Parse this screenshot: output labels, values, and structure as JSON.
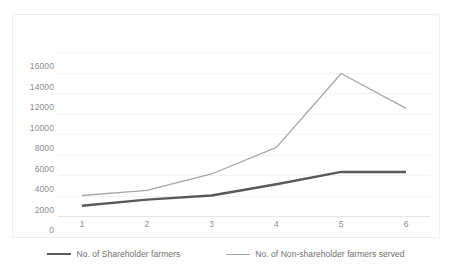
{
  "chart_data": {
    "type": "line",
    "title": "",
    "xlabel": "",
    "ylabel": "",
    "categories": [
      "1",
      "2",
      "3",
      "4",
      "5",
      "6"
    ],
    "ylim": [
      0,
      16000
    ],
    "ytick_step": 2000,
    "yticks": [
      "16000",
      "14000",
      "12000",
      "10000",
      "8000",
      "6000",
      "4000",
      "2000",
      "0"
    ],
    "grid": true,
    "legend_position": "bottom",
    "series": [
      {
        "name": "No. of Shareholder farmers",
        "color": "#595959",
        "width": 2.4,
        "values": [
          1000,
          1600,
          2000,
          3100,
          4300,
          4300
        ]
      },
      {
        "name": "No. of Non-shareholder farmers served",
        "color": "#a6a6a6",
        "width": 1.3,
        "values": [
          2000,
          2500,
          4100,
          6700,
          13900,
          10500
        ]
      }
    ]
  },
  "legend": {
    "items": [
      {
        "label": "No. of Shareholder farmers"
      },
      {
        "label": "No. of Non-shareholder farmers served"
      }
    ]
  },
  "colors": {
    "series_dark": "#595959",
    "series_light": "#a6a6a6",
    "gridline": "#f1f2f4",
    "frame": "#eceef0",
    "tick_text": "#8d8d8d",
    "legend_text": "#6f6f6f"
  }
}
